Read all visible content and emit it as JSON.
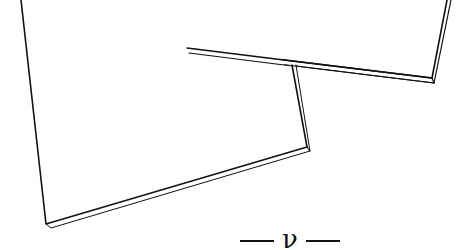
{
  "figure": {
    "type": "line-art illustration",
    "stroke_color": "#111111",
    "background": "#ffffff",
    "panels": [
      {
        "name": "back-panel",
        "outer_points": [
          [
            198,
            0
          ],
          [
            187,
            48
          ],
          [
            432,
            78
          ],
          [
            447,
            0
          ]
        ],
        "thickness_offset": [
          2,
          5
        ]
      },
      {
        "name": "front-panel",
        "outer_points": [
          [
            21,
            0
          ],
          [
            46,
            224
          ],
          [
            307,
            147
          ],
          [
            292,
            65
          ]
        ],
        "thickness_offset": [
          4,
          3
        ]
      }
    ]
  },
  "label": {
    "symbol": "ν",
    "dash_left": "—",
    "dash_right": "—"
  }
}
